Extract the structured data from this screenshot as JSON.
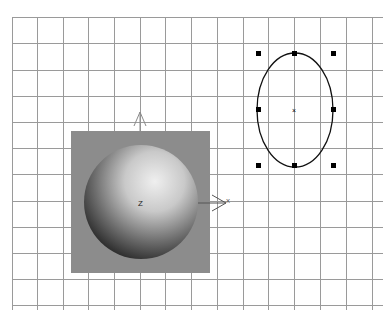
{
  "viewport": {
    "name": "Top viewport",
    "background": "#ffffff",
    "grid": {
      "color": "#9a9a9a",
      "x_lines": [
        12,
        37,
        63,
        88,
        114,
        140,
        165,
        191,
        217,
        243,
        268,
        294,
        320,
        346,
        372
      ],
      "y_lines": [
        17,
        43,
        70,
        96,
        122,
        148,
        174,
        201,
        227,
        253,
        279,
        305
      ],
      "x_extent": [
        12,
        383
      ],
      "y_extent": [
        17,
        310
      ]
    }
  },
  "sphere_object": {
    "label": "Sphere",
    "backdrop_color": "#8c8c8c",
    "highlight_color": "#e6e6e6",
    "shadow_color": "#2a2a2a",
    "pivot_label": "Z",
    "axis_x_label": "X",
    "axis_y_label": "Y"
  },
  "ellipse_object": {
    "label": "Ellipse",
    "stroke_color": "#111111",
    "handle_color": "#000000",
    "center_marker": "×"
  }
}
